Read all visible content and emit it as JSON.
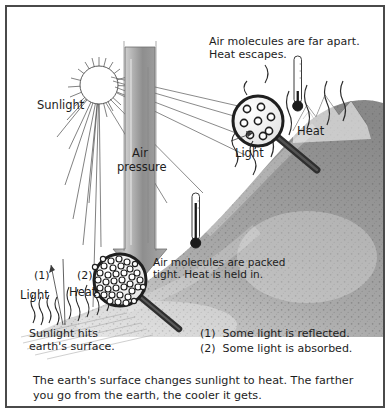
{
  "figure": {
    "type": "science-diagram",
    "background_color": "#ffffff",
    "border_color": "#4a4a4a"
  },
  "labels": {
    "sunlight": "Sunlight",
    "air_pressure": "Air\npressure",
    "far_apart": "Air molecules are far apart.\nHeat escapes.",
    "heat_top": "Heat",
    "light_top": "Light",
    "packed_tight": "Air molecules are packed\ntight. Heat is held in.",
    "marker_1": "(1)",
    "marker_2": "(2)",
    "light_bottom": "Light",
    "heat_bottom": "Heat",
    "sunlight_hits": "Sunlight hits\nearth's surface."
  },
  "legend": {
    "items": [
      "(1)  Some light is reflected.",
      "(2)  Some light is absorbed."
    ]
  },
  "caption": {
    "text": "The earth's surface changes sunlight to heat.  The farther you go from the earth, the cooler it gets."
  },
  "elements": {
    "sun": {
      "name": "sun",
      "rays": 26
    },
    "magnifier_top": {
      "name": "magnifier-sparse-molecules",
      "molecule_count": 8,
      "packing": "far apart"
    },
    "magnifier_bottom": {
      "name": "magnifier-dense-molecules",
      "molecule_count": 46,
      "packing": "packed tight"
    },
    "thermometer_top": {
      "name": "thermometer-high-altitude"
    },
    "thermometer_bottom": {
      "name": "thermometer-low-altitude"
    },
    "mountain": {
      "name": "mountain-slope"
    },
    "heat_waves_top": {
      "count": 5
    },
    "heat_waves_bottom": {
      "count": 9
    },
    "arrow": {
      "name": "air-pressure-arrow",
      "direction": "down"
    }
  }
}
